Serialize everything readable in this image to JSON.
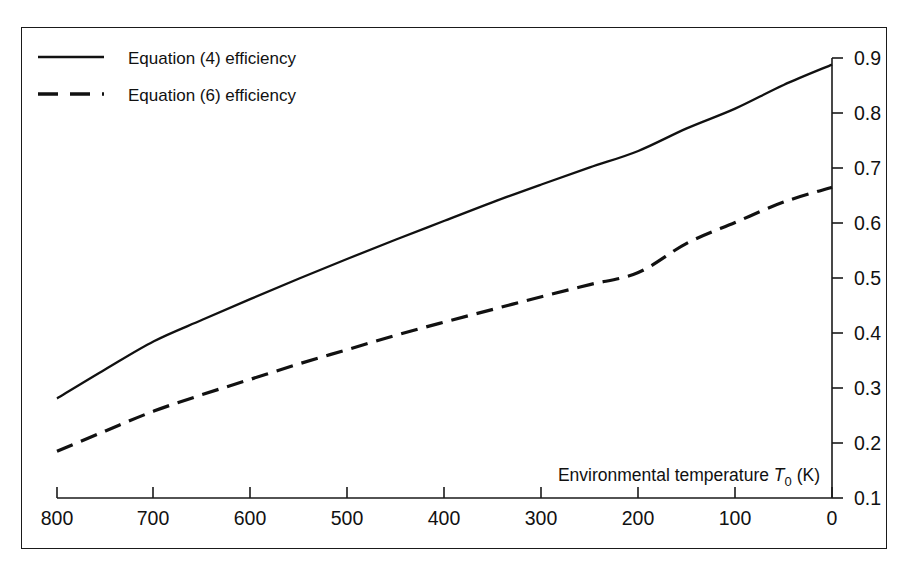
{
  "figure": {
    "background_color": "#ffffff",
    "ink_color": "#111111",
    "border_color": "#1a1a1a"
  },
  "legend": {
    "position": "top-left",
    "entries": [
      {
        "label": "Equation (4) efficiency",
        "style": "solid"
      },
      {
        "label": "Equation (6) efficiency",
        "style": "dashed"
      }
    ]
  },
  "axis_title": {
    "prefix": "Environmental temperature ",
    "symbol": "T",
    "subscript": "0",
    "suffix": " (K)"
  },
  "chart_data": {
    "type": "line",
    "title": "",
    "xlabel": "Environmental temperature T0 (K)",
    "ylabel": "",
    "xlim": [
      800,
      0
    ],
    "ylim": [
      0.1,
      0.9
    ],
    "x_reversed": true,
    "y_axis_position": "right",
    "grid": false,
    "legend_position": "top-left",
    "xticks": [
      800,
      700,
      600,
      500,
      400,
      300,
      200,
      100,
      0
    ],
    "xtick_labels": [
      "800",
      "700",
      "600",
      "500",
      "400",
      "300",
      "200",
      "100",
      "0"
    ],
    "yticks": [
      0.1,
      0.2,
      0.3,
      0.4,
      0.5,
      0.6,
      0.7,
      0.8,
      0.9
    ],
    "ytick_labels": [
      "0.1",
      "0.2",
      "0.3",
      "0.4",
      "0.5",
      "0.6",
      "0.7",
      "0.8",
      "0.9"
    ],
    "x": [
      800,
      750,
      700,
      650,
      600,
      550,
      500,
      450,
      400,
      350,
      300,
      250,
      200,
      150,
      100,
      50,
      0
    ],
    "series": [
      {
        "name": "Equation (4) efficiency",
        "style": "solid",
        "values": [
          0.281,
          0.334,
          0.385,
          0.424,
          0.462,
          0.499,
          0.535,
          0.57,
          0.604,
          0.638,
          0.67,
          0.701,
          0.731,
          0.772,
          0.808,
          0.851,
          0.888
        ]
      },
      {
        "name": "Equation (6) efficiency",
        "style": "dashed",
        "values": [
          0.185,
          0.222,
          0.258,
          0.288,
          0.316,
          0.344,
          0.37,
          0.396,
          0.42,
          0.443,
          0.466,
          0.488,
          0.51,
          0.563,
          0.601,
          0.638,
          0.665
        ]
      }
    ]
  }
}
